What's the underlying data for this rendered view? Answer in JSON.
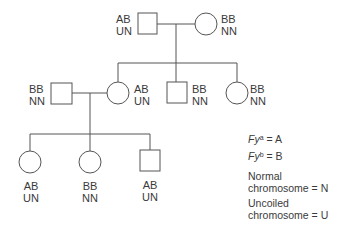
{
  "diagram": {
    "type": "pedigree",
    "generations": [
      {
        "id": "gen1",
        "individuals": [
          {
            "id": "g1-father",
            "sex": "male",
            "genotype": "AB",
            "chromosome": "UN"
          },
          {
            "id": "g1-mother",
            "sex": "female",
            "genotype": "BB",
            "chromosome": "NN"
          }
        ]
      },
      {
        "id": "gen2",
        "individuals": [
          {
            "id": "g2-spouse",
            "sex": "male",
            "genotype": "BB",
            "chromosome": "NN"
          },
          {
            "id": "g2-daughter1",
            "sex": "female",
            "genotype": "AB",
            "chromosome": "UN"
          },
          {
            "id": "g2-son",
            "sex": "male",
            "genotype": "BB",
            "chromosome": "NN"
          },
          {
            "id": "g2-daughter2",
            "sex": "female",
            "genotype": "BB",
            "chromosome": "NN"
          }
        ]
      },
      {
        "id": "gen3",
        "individuals": [
          {
            "id": "g3-daughter1",
            "sex": "female",
            "genotype": "AB",
            "chromosome": "UN"
          },
          {
            "id": "g3-daughter2",
            "sex": "female",
            "genotype": "BB",
            "chromosome": "NN"
          },
          {
            "id": "g3-son",
            "sex": "male",
            "genotype": "AB",
            "chromosome": "UN"
          }
        ]
      }
    ],
    "legend": {
      "fya": {
        "gene": "Fy",
        "allele": "a",
        "equals": "= A"
      },
      "fyb": {
        "gene": "Fy",
        "allele": "b",
        "equals": "= B"
      },
      "normal": {
        "line1": "Normal",
        "line2": "chromosome = N"
      },
      "uncoiled": {
        "line1": "Uncoiled",
        "line2": "chromosome = U"
      }
    }
  }
}
